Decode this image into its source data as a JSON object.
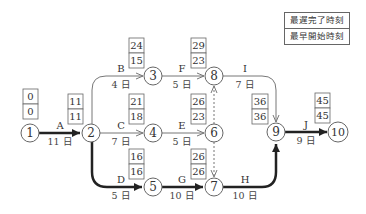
{
  "legend": {
    "top": "最遅完了時刻",
    "bottom": "最早開始時刻"
  },
  "nodes": [
    {
      "id": "1",
      "latest_finish": "0",
      "earliest_start": "0"
    },
    {
      "id": "2",
      "latest_finish": "11",
      "earliest_start": "11"
    },
    {
      "id": "3",
      "latest_finish": "24",
      "earliest_start": "15"
    },
    {
      "id": "4",
      "latest_finish": "21",
      "earliest_start": "18"
    },
    {
      "id": "5",
      "latest_finish": "16",
      "earliest_start": "16"
    },
    {
      "id": "6",
      "latest_finish": "26",
      "earliest_start": "23"
    },
    {
      "id": "7",
      "latest_finish": "26",
      "earliest_start": "26"
    },
    {
      "id": "8",
      "latest_finish": "29",
      "earliest_start": "23"
    },
    {
      "id": "9",
      "latest_finish": "36",
      "earliest_start": "36"
    },
    {
      "id": "10",
      "latest_finish": "45",
      "earliest_start": "45"
    }
  ],
  "activities": [
    {
      "name": "A",
      "duration": "11 日",
      "from": "1",
      "to": "2",
      "critical": true
    },
    {
      "name": "B",
      "duration": "4 日",
      "from": "2",
      "to": "3",
      "critical": false
    },
    {
      "name": "C",
      "duration": "7 日",
      "from": "2",
      "to": "4",
      "critical": false
    },
    {
      "name": "D",
      "duration": "5 日",
      "from": "2",
      "to": "5",
      "critical": true
    },
    {
      "name": "E",
      "duration": "5 日",
      "from": "4",
      "to": "6",
      "critical": false
    },
    {
      "name": "F",
      "duration": "5 日",
      "from": "3",
      "to": "8",
      "critical": false
    },
    {
      "name": "G",
      "duration": "10 日",
      "from": "5",
      "to": "7",
      "critical": true
    },
    {
      "name": "H",
      "duration": "10 日",
      "from": "7",
      "to": "9",
      "critical": true
    },
    {
      "name": "I",
      "duration": "7 日",
      "from": "8",
      "to": "9",
      "critical": false
    },
    {
      "name": "J",
      "duration": "9 日",
      "from": "9",
      "to": "10",
      "critical": true
    }
  ],
  "dummies": [
    {
      "from": "6",
      "to": "8"
    },
    {
      "from": "6",
      "to": "7"
    }
  ],
  "colors": {
    "line": "#777777",
    "critical": "#222222",
    "box": "#666666"
  }
}
